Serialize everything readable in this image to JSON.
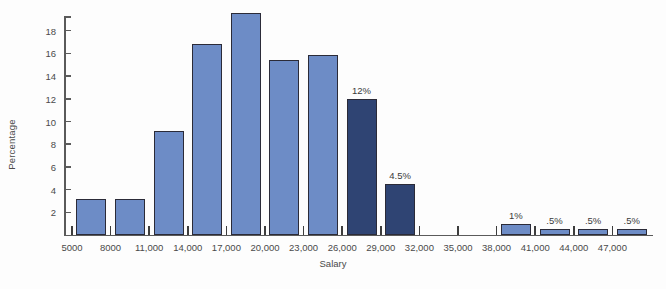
{
  "chart_data": {
    "type": "bar",
    "title": "",
    "xlabel": "Salary",
    "ylabel": "Percentage",
    "ylim": [
      0,
      20
    ],
    "xlim_categories": [
      "5000",
      "8000",
      "11,000",
      "14,000",
      "17,000",
      "20,000",
      "23,000",
      "26,000",
      "29,000",
      "32,000",
      "35,000",
      "38,000",
      "41,000",
      "44,000",
      "47,000"
    ],
    "grid": false,
    "legend": "none",
    "y_ticks": [
      2,
      4,
      6,
      8,
      10,
      12,
      14,
      16,
      18
    ],
    "y_tick_labels": [
      "2",
      "4",
      "6",
      "8",
      "10",
      "12",
      "14",
      "16",
      "18"
    ],
    "categories": [
      "5000",
      "8000",
      "11,000",
      "14,000",
      "17,000",
      "20,000",
      "23,000",
      "26,000",
      "29,000",
      "32,000",
      "35,000",
      "38,000",
      "41,000",
      "44,000",
      "47,000"
    ],
    "values": [
      3.2,
      3.2,
      9.2,
      16.8,
      19.6,
      15.4,
      15.9,
      12,
      4.5,
      0,
      0,
      1,
      0.5,
      0.5,
      0.5
    ],
    "bar_colors": [
      "light",
      "light",
      "light",
      "light",
      "light",
      "light",
      "light",
      "dark",
      "dark",
      "light",
      "light",
      "light",
      "light",
      "light",
      "light"
    ],
    "data_labels": [
      "",
      "",
      "",
      "",
      "",
      "",
      "",
      "12%",
      "4.5%",
      "",
      "",
      "1%",
      ".5%",
      ".5%",
      ".5%"
    ],
    "colors": {
      "light_bar": "#6d8cc6",
      "dark_bar": "#2f4473",
      "bar_outline": "#2b2b38",
      "axis": "#5a5a5a",
      "text": "#4a4a4a",
      "background": "#fdfdfd"
    }
  }
}
